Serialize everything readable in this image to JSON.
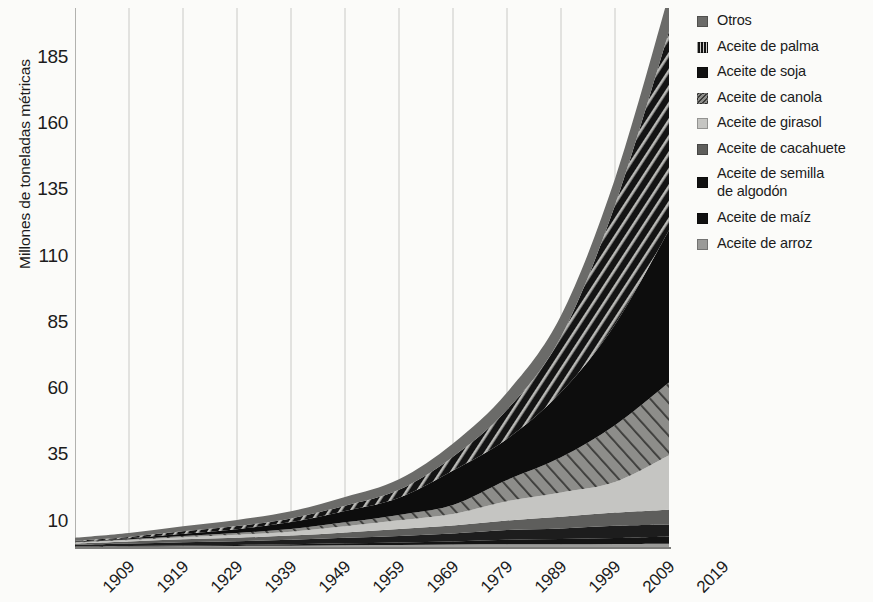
{
  "chart_data": {
    "type": "area",
    "title": "",
    "subtitle": "",
    "xlabel": "",
    "ylabel": "Millones de toneladas métricas",
    "grid": "vertical",
    "legend_position": "right",
    "stacked": true,
    "xlim": [
      1909,
      2019
    ],
    "ylim": [
      0,
      210
    ],
    "yticks": [
      10,
      35,
      60,
      85,
      110,
      135,
      160,
      185,
      210
    ],
    "xticks": [
      1909,
      1919,
      1929,
      1939,
      1949,
      1959,
      1969,
      1979,
      1989,
      1999,
      2009,
      2019
    ],
    "x": [
      1909,
      1919,
      1929,
      1939,
      1949,
      1959,
      1969,
      1979,
      1989,
      1999,
      2009,
      2019
    ],
    "series": [
      {
        "name": "Aceite de arroz",
        "pattern": "solid",
        "color": "#9a9a98",
        "values": [
          0.1,
          0.2,
          0.3,
          0.4,
          0.5,
          0.7,
          0.8,
          0.9,
          1.0,
          1.0,
          1.1,
          1.2
        ]
      },
      {
        "name": "Aceite de maíz",
        "pattern": "solid",
        "color": "#141414",
        "values": [
          0.1,
          0.2,
          0.3,
          0.4,
          0.5,
          0.7,
          0.9,
          1.2,
          1.7,
          2.0,
          2.3,
          2.8
        ]
      },
      {
        "name": "Aceite de semilla de algodón",
        "pattern": "solid",
        "color": "#1d1d1d",
        "values": [
          0.6,
          0.9,
          1.2,
          1.4,
          1.7,
          2.1,
          2.5,
          3.0,
          3.7,
          4.0,
          4.6,
          4.5
        ]
      },
      {
        "name": "Aceite de cacahuete",
        "pattern": "solid",
        "color": "#5e5e5c",
        "values": [
          0.5,
          0.8,
          1.1,
          1.3,
          1.6,
          2.0,
          2.6,
          3.0,
          3.6,
          4.4,
          5.0,
          5.6
        ]
      },
      {
        "name": "Aceite de girasol",
        "pattern": "solid",
        "color": "#c5c5c2",
        "values": [
          0.3,
          0.5,
          0.8,
          1.1,
          1.5,
          2.3,
          3.3,
          4.4,
          7.3,
          9.2,
          11.5,
          20.5
        ]
      },
      {
        "name": "Aceite de canola",
        "pattern": "diagonal",
        "color": "#8d8d8a",
        "values": [
          0.2,
          0.3,
          0.5,
          0.7,
          1.0,
          1.5,
          2.0,
          3.4,
          8.0,
          13.3,
          21.5,
          27.5
        ]
      },
      {
        "name": "Aceite de soja",
        "pattern": "solid",
        "color": "#0d0d0d",
        "values": [
          0.2,
          0.4,
          0.8,
          1.4,
          2.6,
          4.3,
          6.5,
          13.0,
          15.5,
          24.5,
          38.0,
          57.5
        ]
      },
      {
        "name": "Aceite de palma",
        "pattern": "hatch",
        "color": "#1a1a1a",
        "values": [
          0.3,
          0.5,
          0.9,
          1.2,
          1.4,
          2.0,
          3.0,
          5.2,
          11.0,
          21.0,
          45.0,
          75.0
        ]
      },
      {
        "name": "Otros",
        "pattern": "solid",
        "color": "#6b6b69",
        "values": [
          1.2,
          1.5,
          1.9,
          2.3,
          2.7,
          3.3,
          4.0,
          5.0,
          6.5,
          8.0,
          10.0,
          14.0
        ]
      }
    ]
  },
  "axes": {
    "ylabel": "Millones de toneladas métricas",
    "ytick_labels": [
      "210",
      "185",
      "160",
      "135",
      "110",
      "85",
      "60",
      "35",
      "10"
    ],
    "xtick_labels": [
      "1909",
      "1919",
      "1929",
      "1939",
      "1949",
      "1959",
      "1969",
      "1979",
      "1989",
      "1999",
      "2009",
      "2019"
    ]
  },
  "legend": {
    "items": [
      {
        "label": "Otros",
        "swatch": "solid-gray"
      },
      {
        "label": "Aceite de palma",
        "swatch": "vertical-hatch"
      },
      {
        "label": "Aceite de soja",
        "swatch": "solid-black"
      },
      {
        "label": "Aceite de canola",
        "swatch": "diagonal-hatch"
      },
      {
        "label": "Aceite de girasol",
        "swatch": "solid-light-gray"
      },
      {
        "label": "Aceite de cacahuete",
        "swatch": "solid-dark-gray"
      },
      {
        "label": "Aceite de semilla de algodón",
        "swatch": "solid-black"
      },
      {
        "label": "Aceite de maíz",
        "swatch": "solid-black"
      },
      {
        "label": "Aceite de arroz",
        "swatch": "solid-mid-gray"
      }
    ]
  },
  "colors": {
    "otros": "#6b6b69",
    "palma": "#1a1a1a",
    "soja": "#0d0d0d",
    "canola": "#8d8d8a",
    "girasol": "#c5c5c2",
    "cacahuete": "#5e5e5c",
    "algodon": "#1d1d1d",
    "maiz": "#141414",
    "arroz": "#9a9a98",
    "grid": "#c9c9c6",
    "axis": "#9a9a98",
    "background": "#fbfbf9"
  }
}
